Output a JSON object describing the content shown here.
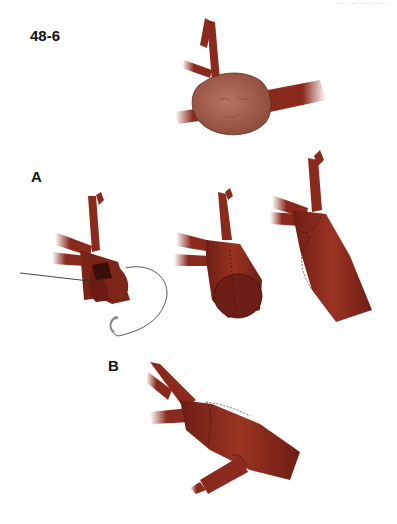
{
  "header_fragment": "··· ·  ··· ·· · ··· ·· ··",
  "figure": {
    "id": "48-6",
    "panels": [
      {
        "label": "",
        "description": "Aneurysm at arterial bifurcation (saccular mass with branching vessels)"
      },
      {
        "label": "A",
        "description": "Resection and reconstruction with suture: opened vessel with needle & thread, tubular closure, completed repair"
      },
      {
        "label": "B",
        "description": "Alternative repair with patch and reimplanted branch"
      }
    ]
  },
  "colors": {
    "vessel": "#8a2a1c",
    "vessel_dark": "#5e1810",
    "aneurysm": "#a8604f",
    "suture": "#333333",
    "background": "#ffffff"
  }
}
